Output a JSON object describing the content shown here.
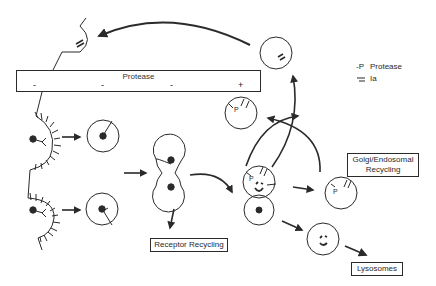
{
  "diagram": {
    "type": "receptor-mediated endocytosis / protease trafficking pathway",
    "protease_bar": {
      "title": "Protease",
      "signs": [
        "-",
        "-",
        "-",
        "+"
      ]
    },
    "legend": {
      "items": [
        {
          "symbol": "-P",
          "label": "Protease"
        },
        {
          "symbol": "=",
          "label": "Ia"
        }
      ]
    },
    "boxes": {
      "receptor_recycling": "Receptor Recycling",
      "golgi_endosomal": [
        "Golgi/Endosomal",
        "Recycling"
      ],
      "lysosomes": "Lysosomes"
    },
    "vesicle_labels": {
      "p_label": "P"
    },
    "colors": {
      "ink": "#2a2a2a",
      "background": "#ffffff"
    }
  }
}
